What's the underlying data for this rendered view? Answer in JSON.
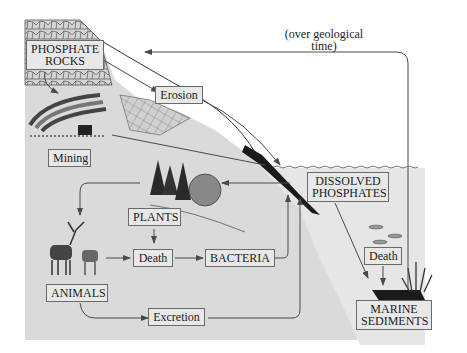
{
  "diagram": {
    "colors": {
      "background": "#ffffff",
      "land": "#dadada",
      "water": "#e6e6e6",
      "label_fill": "#e8e8e8",
      "line": "#4a4a4a",
      "sediment": "#1a1a1a"
    },
    "labels": {
      "phosphate_rocks_line1": "PHOSPHATE",
      "phosphate_rocks_line2": "ROCKS",
      "erosion": "Erosion",
      "mining": "Mining",
      "geological_line1": "(over geological",
      "geological_line2": "time)",
      "dissolved_line1": "DISSOLVED",
      "dissolved_line2": "PHOSPHATES",
      "plants": "PLANTS",
      "death_land": "Death",
      "bacteria": "BACTERIA",
      "animals": "ANIMALS",
      "excretion": "Excretion",
      "death_marine": "Death",
      "marine_line1": "MARINE",
      "marine_line2": "SEDIMENTS"
    },
    "illustrations": {
      "rocks": "phosphate-rock-outcrop",
      "mine": "open-pit-mine-with-cart",
      "trees": "conifer-trees-and-shrub",
      "animals": "kudu-antelopes",
      "fish": "three-fish",
      "seaweed": "seagrass"
    },
    "flows": [
      {
        "from": "PHOSPHATE ROCKS",
        "to": "Erosion"
      },
      {
        "from": "Erosion",
        "to": "DISSOLVED PHOSPHATES"
      },
      {
        "from": "Mining",
        "to": "DISSOLVED PHOSPHATES"
      },
      {
        "from": "DISSOLVED PHOSPHATES",
        "to": "PLANTS"
      },
      {
        "from": "PLANTS",
        "to": "ANIMALS"
      },
      {
        "from": "PLANTS",
        "to": "Death"
      },
      {
        "from": "ANIMALS",
        "to": "Death"
      },
      {
        "from": "Death",
        "to": "BACTERIA"
      },
      {
        "from": "BACTERIA",
        "to": "DISSOLVED PHOSPHATES"
      },
      {
        "from": "ANIMALS",
        "to": "Excretion"
      },
      {
        "from": "Excretion",
        "to": "DISSOLVED PHOSPHATES"
      },
      {
        "from": "DISSOLVED PHOSPHATES",
        "to": "MARINE SEDIMENTS"
      },
      {
        "from": "Death (marine)",
        "to": "MARINE SEDIMENTS"
      },
      {
        "from": "MARINE SEDIMENTS",
        "to": "PHOSPHATE ROCKS",
        "note": "(over geological time)"
      }
    ]
  }
}
